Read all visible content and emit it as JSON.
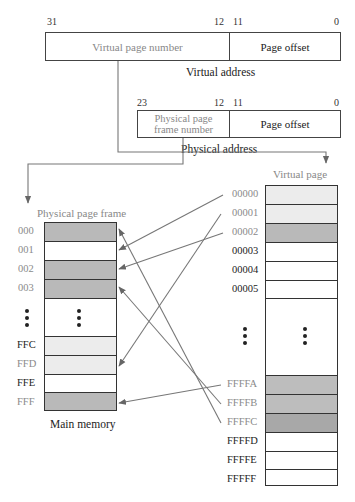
{
  "virtual_address": {
    "bits": {
      "high": "31",
      "mid_left": "12",
      "mid_right": "11",
      "low": "0"
    },
    "fields": {
      "page_number": "Virtual page number",
      "offset": "Page offset"
    },
    "caption": "Virtual address"
  },
  "physical_address": {
    "bits": {
      "high": "23",
      "mid_left": "12",
      "mid_right": "11",
      "low": "0"
    },
    "fields": {
      "frame_number_line1": "Physical page",
      "frame_number_line2": "frame number",
      "offset": "Page offset"
    },
    "caption": "Physical address"
  },
  "main_memory": {
    "title": "Physical page frame",
    "caption": "Main memory",
    "rows": [
      {
        "label": "000",
        "fill": "#b9b9b9",
        "label_color": "gray"
      },
      {
        "label": "001",
        "fill": "#ffffff",
        "label_color": "gray"
      },
      {
        "label": "002",
        "fill": "#b9b9b9",
        "label_color": "gray"
      },
      {
        "label": "003",
        "fill": "#b9b9b9",
        "label_color": "gray"
      },
      {
        "label": "FFC",
        "fill": "#ececec",
        "label_color": "dark"
      },
      {
        "label": "FFD",
        "fill": "#ececec",
        "label_color": "gray"
      },
      {
        "label": "FFE",
        "fill": "#ffffff",
        "label_color": "dark"
      },
      {
        "label": "FFF",
        "fill": "#b9b9b9",
        "label_color": "gray"
      }
    ]
  },
  "virtual_pages": {
    "title": "Virtual page",
    "rows": [
      {
        "label": "00000",
        "fill": "#ececec",
        "label_color": "gray"
      },
      {
        "label": "00001",
        "fill": "#ececec",
        "label_color": "gray"
      },
      {
        "label": "00002",
        "fill": "#b9b9b9",
        "label_color": "gray"
      },
      {
        "label": "00003",
        "fill": "#ffffff",
        "label_color": "dark"
      },
      {
        "label": "00004",
        "fill": "#ffffff",
        "label_color": "dark"
      },
      {
        "label": "00005",
        "fill": "#ffffff",
        "label_color": "dark"
      },
      {
        "label": "FFFFA",
        "fill": "#bdbdbd",
        "label_color": "gray"
      },
      {
        "label": "FFFFB",
        "fill": "#bdbdbd",
        "label_color": "gray"
      },
      {
        "label": "FFFFC",
        "fill": "#a8a8a8",
        "label_color": "gray"
      },
      {
        "label": "FFFFD",
        "fill": "#ffffff",
        "label_color": "dark"
      },
      {
        "label": "FFFFE",
        "fill": "#ffffff",
        "label_color": "dark"
      },
      {
        "label": "FFFFF",
        "fill": "#ffffff",
        "label_color": "dark"
      }
    ]
  },
  "mappings": [
    {
      "from": "00000",
      "to": "001"
    },
    {
      "from": "00001",
      "to": "FFD"
    },
    {
      "from": "00002",
      "to": "002"
    },
    {
      "from": "FFFFA",
      "to": "FFF"
    },
    {
      "from": "FFFFB",
      "to": "003"
    },
    {
      "from": "FFFFC",
      "to": "000"
    }
  ],
  "colors": {
    "line": "#777777",
    "border": "#333333",
    "dark_gray_fill": "#b9b9b9",
    "light_gray_fill": "#ececec"
  }
}
